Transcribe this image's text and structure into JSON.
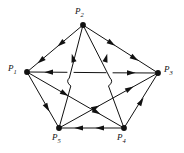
{
  "figure": {
    "type": "directed-graph",
    "title": "",
    "background_color": "#ffffff",
    "edge_color": "#111111",
    "vertex_color": "#111111"
  },
  "vertices": [
    {
      "id": "P1",
      "label": "P",
      "sub": "1",
      "x": 27,
      "y": 72,
      "label_x": 8,
      "label_y": 66
    },
    {
      "id": "P2",
      "label": "P",
      "sub": "2",
      "x": 83,
      "y": 25,
      "label_x": 75,
      "label_y": 8
    },
    {
      "id": "P3",
      "label": "P",
      "sub": "3",
      "x": 158,
      "y": 73,
      "label_x": 164,
      "label_y": 67
    },
    {
      "id": "P4",
      "label": "P",
      "sub": "4",
      "x": 124,
      "y": 128,
      "label_x": 117,
      "label_y": 134
    },
    {
      "id": "P5",
      "label": "P",
      "sub": "5",
      "x": 59,
      "y": 128,
      "label_x": 52,
      "label_y": 134
    }
  ],
  "edges": [
    {
      "from": "P2",
      "to": "P1",
      "arrows": 2,
      "note": "upper-left outer edge"
    },
    {
      "from": "P2",
      "to": "P3",
      "arrows": 2,
      "note": "upper-right outer edge"
    },
    {
      "from": "P5",
      "to": "P2",
      "arrows": 1,
      "note": "inner edge rising to apex"
    },
    {
      "from": "P4",
      "to": "P2",
      "arrows": 1,
      "note": "inner edge rising to apex"
    },
    {
      "from": "P4",
      "to": "P1",
      "arrows": 1,
      "note": "horizontal, arrow toward P1"
    },
    {
      "from": "P5",
      "to": "P3",
      "arrows": 1,
      "note": "horizontal, arrow toward P3"
    },
    {
      "from": "P1",
      "to": "P5",
      "arrows": 1,
      "note": "lower-left outer edge"
    },
    {
      "from": "P1",
      "to": "P4",
      "arrows": 1,
      "note": "lower-left diagonal"
    },
    {
      "from": "P5",
      "to": "P3",
      "arrows": 1,
      "note": "lower-right diagonal"
    },
    {
      "from": "P4",
      "to": "P3",
      "arrows": 1,
      "note": "lower-right outer edge"
    },
    {
      "from": "P4",
      "to": "P5",
      "arrows": 2,
      "note": "bottom edge, arrows toward P5"
    }
  ]
}
